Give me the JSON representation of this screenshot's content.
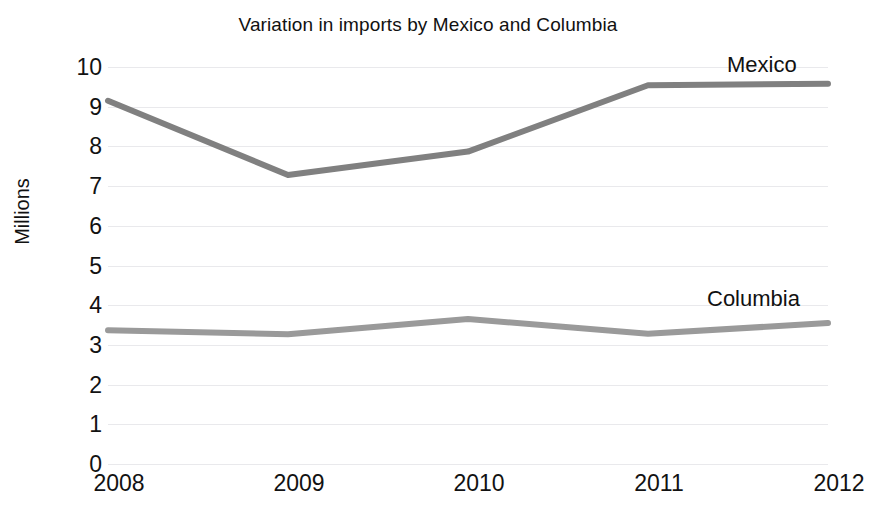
{
  "chart_data": {
    "type": "line",
    "title": "Variation in imports by Mexico and Columbia",
    "xlabel": "",
    "ylabel": "Millions",
    "categories": [
      "2008",
      "2009",
      "2010",
      "2011",
      "2012"
    ],
    "x_tick_labels": [
      "2008",
      "2009",
      "2010",
      "2011",
      "2012"
    ],
    "y_tick_labels": [
      "10",
      "9",
      "8",
      "7",
      "6",
      "5",
      "4",
      "3",
      "2",
      "1",
      "0"
    ],
    "ylim": [
      0,
      10
    ],
    "y_tick_step": 1,
    "grid": "horizontal",
    "legend_position": "direct-labels-right",
    "series": [
      {
        "name": "Mexico",
        "color": "#808080",
        "values": [
          9.15,
          7.28,
          7.87,
          9.54,
          9.58
        ]
      },
      {
        "name": "Columbia",
        "color": "#9a9a9a",
        "values": [
          3.37,
          3.27,
          3.65,
          3.28,
          3.55
        ]
      }
    ],
    "annotations": [
      {
        "text": "Mexico",
        "series": "Mexico"
      },
      {
        "text": "Columbia",
        "series": "Columbia"
      }
    ],
    "colors": {
      "background": "#ffffff",
      "text": "#111111",
      "gridline": "#e9e9ec",
      "mexico_line": "#808080",
      "columbia_line": "#9a9a9a"
    }
  }
}
